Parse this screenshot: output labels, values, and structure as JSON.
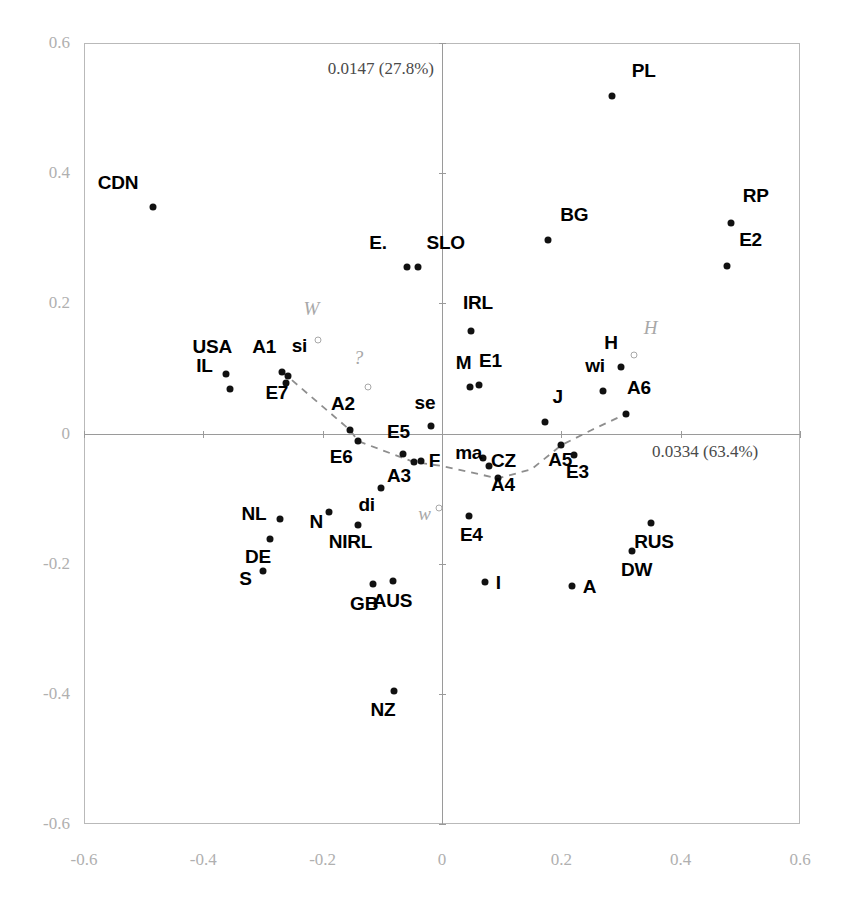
{
  "chart_data": {
    "type": "scatter",
    "title": "",
    "subtitle": "",
    "xlabel": "0.0334 (63.4%)",
    "ylabel": "0.0147 (27.8%)",
    "xlim": [
      -0.6,
      0.6
    ],
    "ylim": [
      -0.6,
      0.6
    ],
    "xticks": [
      "-0.6",
      "-0.4",
      "-0.2",
      "0",
      "0.2",
      "0.4",
      "0.6"
    ],
    "xtick_values": [
      -0.6,
      -0.4,
      -0.2,
      0,
      0.2,
      0.4,
      0.6
    ],
    "yticks": [
      "0.6",
      "0.4",
      "0.2",
      "0",
      "-0.2",
      "-0.4",
      "-0.6"
    ],
    "ytick_values": [
      0.6,
      0.4,
      0.2,
      0,
      -0.2,
      -0.4,
      -0.6
    ],
    "grid": false,
    "legend": "none",
    "axis_inertia": {
      "horizontal": "0.0334 (63.4%)",
      "vertical": "0.0147 (27.8%)"
    },
    "marker_styles": {
      "filled": "solid black dot — active points",
      "open": "hollow gray dot — supplementary points"
    },
    "points": [
      {
        "label": "CDN",
        "x": -0.484,
        "y": 0.348,
        "style": "filled",
        "lx": -0.543,
        "ly": 0.381,
        "anchor": "center"
      },
      {
        "label": "PL",
        "x": 0.285,
        "y": 0.518,
        "style": "filled",
        "lx": 0.318,
        "ly": 0.553,
        "anchor": "start"
      },
      {
        "label": "RP",
        "x": 0.484,
        "y": 0.324,
        "style": "filled",
        "lx": 0.504,
        "ly": 0.36,
        "anchor": "start"
      },
      {
        "label": "E2",
        "x": 0.478,
        "y": 0.258,
        "style": "filled",
        "lx": 0.498,
        "ly": 0.293,
        "anchor": "start"
      },
      {
        "label": "BG",
        "x": 0.178,
        "y": 0.297,
        "style": "filled",
        "lx": 0.198,
        "ly": 0.331,
        "anchor": "start"
      },
      {
        "label": "E.",
        "x": -0.058,
        "y": 0.256,
        "style": "filled",
        "lx": -0.122,
        "ly": 0.288,
        "anchor": "start"
      },
      {
        "label": "SLO",
        "x": -0.04,
        "y": 0.256,
        "style": "filled",
        "lx": -0.026,
        "ly": 0.288,
        "anchor": "start"
      },
      {
        "label": "IRL",
        "x": 0.049,
        "y": 0.158,
        "style": "filled",
        "lx": 0.035,
        "ly": 0.196,
        "anchor": "start"
      },
      {
        "label": "USA",
        "x": -0.362,
        "y": 0.092,
        "style": "filled",
        "lx": -0.418,
        "ly": 0.128,
        "anchor": "start"
      },
      {
        "label": "IL",
        "x": -0.355,
        "y": 0.069,
        "style": "filled",
        "lx": -0.412,
        "ly": 0.099,
        "anchor": "start"
      },
      {
        "label": "A1",
        "x": -0.268,
        "y": 0.095,
        "style": "filled",
        "lx": -0.318,
        "ly": 0.128,
        "anchor": "start"
      },
      {
        "label": "si",
        "x": -0.258,
        "y": 0.089,
        "style": "filled",
        "lx": -0.252,
        "ly": 0.13,
        "anchor": "start"
      },
      {
        "label": "E7",
        "x": -0.262,
        "y": 0.077,
        "style": "filled",
        "lx": -0.296,
        "ly": 0.057,
        "anchor": "start"
      },
      {
        "label": "M",
        "x": 0.047,
        "y": 0.071,
        "style": "filled",
        "lx": 0.023,
        "ly": 0.103,
        "anchor": "start"
      },
      {
        "label": "E1",
        "x": 0.062,
        "y": 0.074,
        "style": "filled",
        "lx": 0.062,
        "ly": 0.107,
        "anchor": "start"
      },
      {
        "label": "H",
        "x": 0.3,
        "y": 0.102,
        "style": "filled",
        "lx": 0.272,
        "ly": 0.134,
        "anchor": "start"
      },
      {
        "label": "wi",
        "x": 0.27,
        "y": 0.066,
        "style": "filled",
        "lx": 0.24,
        "ly": 0.099,
        "anchor": "start"
      },
      {
        "label": "A6",
        "x": 0.308,
        "y": 0.03,
        "style": "filled",
        "lx": 0.31,
        "ly": 0.066,
        "anchor": "start"
      },
      {
        "label": "J",
        "x": 0.172,
        "y": 0.018,
        "style": "filled",
        "lx": 0.185,
        "ly": 0.052,
        "anchor": "start"
      },
      {
        "label": "A2",
        "x": -0.155,
        "y": 0.006,
        "style": "filled",
        "lx": -0.186,
        "ly": 0.041,
        "anchor": "start"
      },
      {
        "label": "se",
        "x": -0.018,
        "y": 0.011,
        "style": "filled",
        "lx": -0.046,
        "ly": 0.043,
        "anchor": "start"
      },
      {
        "label": "E6",
        "x": -0.14,
        "y": -0.012,
        "style": "filled",
        "lx": -0.188,
        "ly": -0.04,
        "anchor": "start"
      },
      {
        "label": "E5",
        "x": -0.066,
        "y": -0.032,
        "style": "filled",
        "lx": -0.092,
        "ly": -0.003,
        "anchor": "start"
      },
      {
        "label": "A3",
        "x": -0.047,
        "y": -0.044,
        "style": "filled",
        "lx": -0.092,
        "ly": -0.07,
        "anchor": "start"
      },
      {
        "label": "F",
        "x": -0.036,
        "y": -0.043,
        "style": "filled",
        "lx": -0.022,
        "ly": -0.047,
        "anchor": "start"
      },
      {
        "label": "ma",
        "x": 0.068,
        "y": -0.038,
        "style": "filled",
        "lx": 0.022,
        "ly": -0.034,
        "anchor": "start"
      },
      {
        "label": "CZ",
        "x": 0.078,
        "y": -0.05,
        "style": "filled",
        "lx": 0.082,
        "ly": -0.047,
        "anchor": "start"
      },
      {
        "label": "A4",
        "x": 0.094,
        "y": -0.069,
        "style": "filled",
        "lx": 0.082,
        "ly": -0.083,
        "anchor": "start"
      },
      {
        "label": "A5",
        "x": 0.2,
        "y": -0.018,
        "style": "filled",
        "lx": 0.178,
        "ly": -0.046,
        "anchor": "start"
      },
      {
        "label": "E3",
        "x": 0.222,
        "y": -0.033,
        "style": "filled",
        "lx": 0.208,
        "ly": -0.063,
        "anchor": "start"
      },
      {
        "label": "di",
        "x": -0.103,
        "y": -0.083,
        "style": "filled",
        "lx": -0.14,
        "ly": -0.115,
        "anchor": "start"
      },
      {
        "label": "NL",
        "x": -0.272,
        "y": -0.132,
        "style": "filled",
        "lx": -0.336,
        "ly": -0.128,
        "anchor": "start"
      },
      {
        "label": "N",
        "x": -0.19,
        "y": -0.12,
        "style": "filled",
        "lx": -0.222,
        "ly": -0.14,
        "anchor": "start"
      },
      {
        "label": "NIRL",
        "x": -0.14,
        "y": -0.14,
        "style": "filled",
        "lx": -0.19,
        "ly": -0.172,
        "anchor": "start"
      },
      {
        "label": "DE",
        "x": -0.288,
        "y": -0.162,
        "style": "filled",
        "lx": -0.33,
        "ly": -0.194,
        "anchor": "start"
      },
      {
        "label": "S",
        "x": -0.3,
        "y": -0.212,
        "style": "filled",
        "lx": -0.34,
        "ly": -0.228,
        "anchor": "start"
      },
      {
        "label": "GB",
        "x": -0.116,
        "y": -0.232,
        "style": "filled",
        "lx": -0.154,
        "ly": -0.266,
        "anchor": "start"
      },
      {
        "label": "AUS",
        "x": -0.082,
        "y": -0.226,
        "style": "filled",
        "lx": -0.116,
        "ly": -0.262,
        "anchor": "start"
      },
      {
        "label": "NZ",
        "x": -0.08,
        "y": -0.396,
        "style": "filled",
        "lx": -0.12,
        "ly": -0.43,
        "anchor": "start"
      },
      {
        "label": "E4",
        "x": 0.046,
        "y": -0.126,
        "style": "filled",
        "lx": 0.03,
        "ly": -0.16,
        "anchor": "start"
      },
      {
        "label": "I",
        "x": 0.072,
        "y": -0.228,
        "style": "filled",
        "lx": 0.09,
        "ly": -0.234,
        "anchor": "start"
      },
      {
        "label": "A",
        "x": 0.218,
        "y": -0.235,
        "style": "filled",
        "lx": 0.236,
        "ly": -0.24,
        "anchor": "start"
      },
      {
        "label": "RUS",
        "x": 0.35,
        "y": -0.138,
        "style": "filled",
        "lx": 0.322,
        "ly": -0.172,
        "anchor": "start"
      },
      {
        "label": "DW",
        "x": 0.318,
        "y": -0.18,
        "style": "filled",
        "lx": 0.3,
        "ly": -0.214,
        "anchor": "start"
      }
    ],
    "supplementary_points": [
      {
        "label": "W",
        "x": -0.207,
        "y": 0.143,
        "style": "open",
        "lx": -0.232,
        "ly": 0.186
      },
      {
        "label": "?",
        "x": -0.124,
        "y": 0.071,
        "style": "open",
        "lx": -0.148,
        "ly": 0.112
      },
      {
        "label": "w",
        "x": -0.005,
        "y": -0.115,
        "style": "open",
        "lx": -0.04,
        "ly": -0.128
      },
      {
        "label": "H",
        "x": 0.322,
        "y": 0.12,
        "style": "open",
        "lx": 0.338,
        "ly": 0.158
      }
    ],
    "trend_curve": {
      "description": "dashed gray connecting curve through ordered category points A1..A6",
      "style": "dashed",
      "color": "#8e8e8e",
      "vertices": [
        [
          -0.268,
          0.095
        ],
        [
          -0.155,
          0.006
        ],
        [
          -0.14,
          -0.012
        ],
        [
          -0.047,
          -0.044
        ],
        [
          0.0,
          -0.05
        ],
        [
          0.094,
          -0.069
        ],
        [
          0.15,
          -0.055
        ],
        [
          0.2,
          -0.018
        ],
        [
          0.25,
          0.005
        ],
        [
          0.308,
          0.03
        ]
      ]
    }
  }
}
